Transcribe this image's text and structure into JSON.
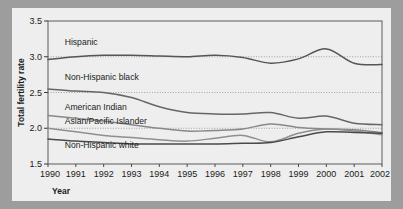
{
  "chart_data": {
    "type": "line",
    "title": "",
    "subtitle": "",
    "xlabel": "Year",
    "ylabel": "Total fertility rate",
    "xlim": [
      1990,
      2002
    ],
    "ylim": [
      1.5,
      3.5
    ],
    "xticks": [
      "1990",
      "1991",
      "1992",
      "1993",
      "1994",
      "1995",
      "1996",
      "1997",
      "1998",
      "1999",
      "2000",
      "2001",
      "2002"
    ],
    "yticks": [
      "1.5",
      "2.0",
      "2.5",
      "3.0",
      "3.5"
    ],
    "grid": "horizontal-dotted",
    "gridlines": [
      2.0,
      2.5,
      3.0
    ],
    "legend_position": "inline-labels",
    "x": [
      1990,
      1991,
      1992,
      1993,
      1994,
      1995,
      1996,
      1997,
      1998,
      1999,
      2000,
      2001,
      2002
    ],
    "series": [
      {
        "name": "Hispanic",
        "color": "#555555",
        "label_x": 1990.6,
        "label_y": 3.16,
        "values": [
          2.96,
          3.0,
          3.02,
          3.02,
          3.01,
          3.0,
          3.02,
          2.99,
          2.91,
          2.97,
          3.11,
          2.91,
          2.89
        ]
      },
      {
        "name": "Non-Hispanic black",
        "color": "#666666",
        "label_x": 1990.6,
        "label_y": 2.67,
        "values": [
          2.55,
          2.52,
          2.5,
          2.43,
          2.3,
          2.22,
          2.2,
          2.2,
          2.22,
          2.14,
          2.17,
          2.07,
          2.05
        ]
      },
      {
        "name": "American Indian",
        "color": "#888888",
        "label_x": 1990.6,
        "label_y": 2.26,
        "values": [
          2.18,
          2.14,
          2.1,
          2.05,
          2.0,
          1.96,
          1.97,
          1.99,
          2.06,
          2.01,
          1.99,
          1.98,
          1.94
        ]
      },
      {
        "name": "Asian/Pacific Islander",
        "color": "#8f8f8f",
        "label_x": 1990.6,
        "label_y": 2.06,
        "values": [
          2.0,
          1.95,
          1.9,
          1.87,
          1.84,
          1.82,
          1.86,
          1.9,
          1.81,
          1.93,
          1.99,
          1.96,
          1.91
        ]
      },
      {
        "name": "Non-Hispanic white",
        "color": "#4a4a4a",
        "label_x": 1990.6,
        "label_y": 1.72,
        "values": [
          1.85,
          1.82,
          1.8,
          1.78,
          1.78,
          1.78,
          1.78,
          1.79,
          1.8,
          1.88,
          1.95,
          1.94,
          1.93
        ]
      }
    ]
  }
}
